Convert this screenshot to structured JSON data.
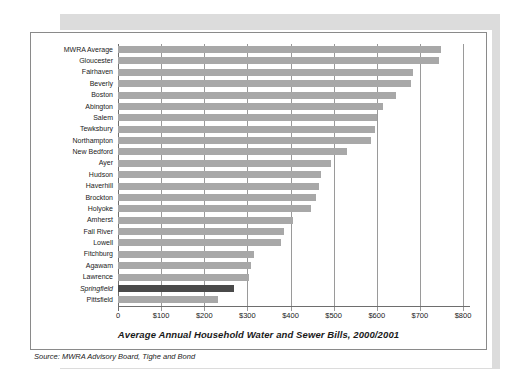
{
  "chart_data": {
    "type": "bar",
    "orientation": "horizontal",
    "title": "Average Annual Household Water and Sewer Bills, 2000/2001",
    "xlabel": "",
    "ylabel": "",
    "xlim": [
      0,
      800
    ],
    "xtick_labels": [
      "0",
      "$100",
      "$200",
      "$300",
      "$400",
      "$500",
      "$600",
      "$700",
      "$800"
    ],
    "xtick_values": [
      0,
      100,
      200,
      300,
      400,
      500,
      600,
      700,
      800
    ],
    "grid": true,
    "legend": "none",
    "categories": [
      "MWRA Average",
      "Gloucester",
      "Fairhaven",
      "Beverly",
      "Boston",
      "Abington",
      "Salem",
      "Tewksbury",
      "Northampton",
      "New Bedford",
      "Ayer",
      "Hudson",
      "Haverhill",
      "Brockton",
      "Holyoke",
      "Amherst",
      "Fall River",
      "Lowell",
      "Fitchburg",
      "Agawam",
      "Lawrence",
      "Springfield",
      "Pittsfield"
    ],
    "values": [
      750,
      745,
      685,
      680,
      645,
      615,
      600,
      595,
      587,
      530,
      494,
      471,
      466,
      460,
      448,
      406,
      385,
      378,
      316,
      308,
      304,
      269,
      232
    ],
    "highlighted_category": "Springfield",
    "bar_color": "#a8a8a8",
    "highlight_color": "#4a4a4a"
  },
  "source": {
    "label": "Source:",
    "text": " MWRA Advisory Board, Tighe and Bond",
    "full": "Source: MWRA Advisory Board, Tighe and Bond"
  }
}
